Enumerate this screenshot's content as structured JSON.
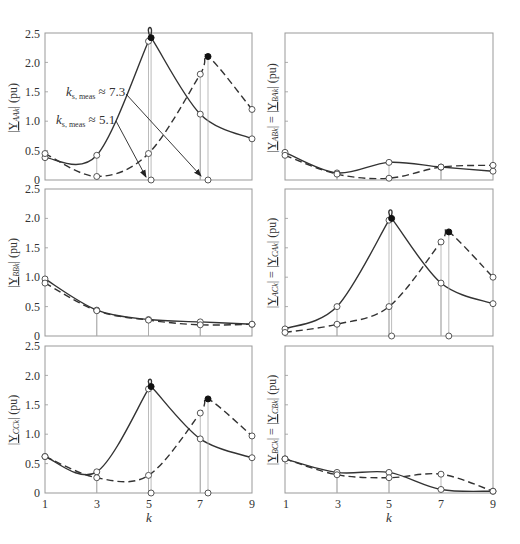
{
  "chart_data": [
    {
      "type": "line",
      "panel": "top-left",
      "ylabel": "|Y_AAk| (pu)",
      "ylabel_main": "|Y",
      "ylabel_sub": "AAk",
      "ylabel_tail": "| (pu)",
      "xlabel": "",
      "ylim": [
        0,
        2.5
      ],
      "yticks": [
        "0",
        "0.5",
        "1.0",
        "1.5",
        "2.0",
        "2.5"
      ],
      "show_yticks": true,
      "show_xticks": false,
      "x": [
        1,
        3,
        5,
        7,
        9
      ],
      "series": [
        {
          "name": "solid",
          "style": "solid",
          "values": [
            0.38,
            0.42,
            2.36,
            1.12,
            0.7
          ],
          "peak": {
            "k": 5.1,
            "value": 2.42
          }
        },
        {
          "name": "dashed",
          "style": "dashed",
          "values": [
            0.45,
            0.06,
            0.45,
            1.8,
            1.2
          ],
          "peak": {
            "k": 7.3,
            "value": 2.1
          }
        }
      ],
      "annotations": [
        {
          "text_main": "k",
          "text_sub": "s, meas",
          "text_tail": " ≈ 7.3",
          "value": 7.3
        },
        {
          "text_main": "k",
          "text_sub": "s, meas",
          "text_tail": " ≈ 5.1",
          "value": 5.1
        }
      ]
    },
    {
      "type": "line",
      "panel": "top-right",
      "ylabel": "|Y_ABk| = |Y_BAk| (pu)",
      "ylim": [
        0,
        2.5
      ],
      "show_yticks": false,
      "show_xticks": false,
      "x": [
        1,
        3,
        5,
        7,
        9
      ],
      "series": [
        {
          "name": "solid",
          "style": "solid",
          "values": [
            0.47,
            0.12,
            0.3,
            0.22,
            0.15
          ]
        },
        {
          "name": "dashed",
          "style": "dashed",
          "values": [
            0.42,
            0.1,
            0.03,
            0.22,
            0.25
          ]
        }
      ]
    },
    {
      "type": "line",
      "panel": "middle-left",
      "ylabel": "|Y_BBk| (pu)",
      "ylim": [
        0,
        2.5
      ],
      "yticks": [
        "0",
        "0.5",
        "1.0",
        "1.5",
        "2.0",
        "2.5"
      ],
      "show_yticks": true,
      "show_xticks": false,
      "x": [
        1,
        3,
        5,
        7,
        9
      ],
      "series": [
        {
          "name": "solid",
          "style": "solid",
          "values": [
            0.97,
            0.44,
            0.28,
            0.24,
            0.2
          ]
        },
        {
          "name": "dashed",
          "style": "dashed",
          "values": [
            0.9,
            0.43,
            0.27,
            0.19,
            0.2
          ]
        }
      ]
    },
    {
      "type": "line",
      "panel": "middle-right",
      "ylabel": "|Y_ACk| = |Y_CAk| (pu)",
      "ylim": [
        0,
        2.5
      ],
      "show_yticks": false,
      "show_xticks": false,
      "x": [
        1,
        3,
        5,
        7,
        9
      ],
      "series": [
        {
          "name": "solid",
          "style": "solid",
          "values": [
            0.12,
            0.5,
            1.97,
            0.9,
            0.55
          ],
          "peak": {
            "k": 5.1,
            "value": 2.0
          }
        },
        {
          "name": "dashed",
          "style": "dashed",
          "values": [
            0.06,
            0.2,
            0.5,
            1.6,
            1.0
          ],
          "peak": {
            "k": 7.3,
            "value": 1.77
          }
        }
      ]
    },
    {
      "type": "line",
      "panel": "bottom-left",
      "ylabel": "|Y_CCk| (pu)",
      "xlabel": "k",
      "ylim": [
        0,
        2.5
      ],
      "yticks": [
        "0",
        "0.5",
        "1.0",
        "1.5",
        "2.0",
        "2.5"
      ],
      "xticks": [
        "1",
        "3",
        "5",
        "7",
        "9"
      ],
      "show_yticks": true,
      "show_xticks": true,
      "x": [
        1,
        3,
        5,
        7,
        9
      ],
      "series": [
        {
          "name": "solid",
          "style": "solid",
          "values": [
            0.62,
            0.36,
            1.77,
            0.92,
            0.6
          ],
          "peak": {
            "k": 5.1,
            "value": 1.81
          }
        },
        {
          "name": "dashed",
          "style": "dashed",
          "values": [
            0.62,
            0.26,
            0.3,
            1.36,
            0.97
          ],
          "peak": {
            "k": 7.3,
            "value": 1.6
          }
        }
      ]
    },
    {
      "type": "line",
      "panel": "bottom-right",
      "ylabel": "|Y_BCk| = |Y_CBk| (pu)",
      "xlabel": "k",
      "ylim": [
        0,
        2.5
      ],
      "xticks": [
        "1",
        "3",
        "5",
        "7",
        "9"
      ],
      "show_yticks": false,
      "show_xticks": true,
      "x": [
        1,
        3,
        5,
        7,
        9
      ],
      "series": [
        {
          "name": "solid",
          "style": "solid",
          "values": [
            0.58,
            0.35,
            0.35,
            0.06,
            0.03
          ]
        },
        {
          "name": "dashed",
          "style": "dashed",
          "values": [
            0.58,
            0.31,
            0.26,
            0.32,
            0.03
          ]
        }
      ]
    }
  ],
  "labels": {
    "p1_y_a": "|",
    "p1_y_b": "Y",
    "p1_y_sub": "AAk",
    "p1_y_c": "| (pu)",
    "p2_y_b1": "Y",
    "p2_y_s1": "ABk",
    "p2_y_mid": "| = |",
    "p2_y_b2": "Y",
    "p2_y_s2": "BAk",
    "p2_y_c": "| (pu)",
    "p3_y_b": "Y",
    "p3_y_sub": "BBk",
    "p4_y_b1": "Y",
    "p4_y_s1": "ACk",
    "p4_y_b2": "Y",
    "p4_y_s2": "CAk",
    "p5_y_b": "Y",
    "p5_y_sub": "CCk",
    "p6_y_b1": "Y",
    "p6_y_s1": "BCk",
    "p6_y_b2": "Y",
    "p6_y_s2": "CBk",
    "open": "|",
    "close_pu": "| (pu)",
    "eq": "| = |",
    "x_k": "k",
    "ann1_main": "k",
    "ann1_sub": "s, meas",
    "ann1_tail": " ≈ 7.3",
    "ann2_main": "k",
    "ann2_sub": "s, meas",
    "ann2_tail": " ≈ 5.1",
    "yt0": "0",
    "yt05": "0.5",
    "yt10": "1.0",
    "yt15": "1.5",
    "yt20": "2.0",
    "yt25": "2.5",
    "xt1": "1",
    "xt3": "3",
    "xt5": "5",
    "xt7": "7",
    "xt9": "9"
  }
}
